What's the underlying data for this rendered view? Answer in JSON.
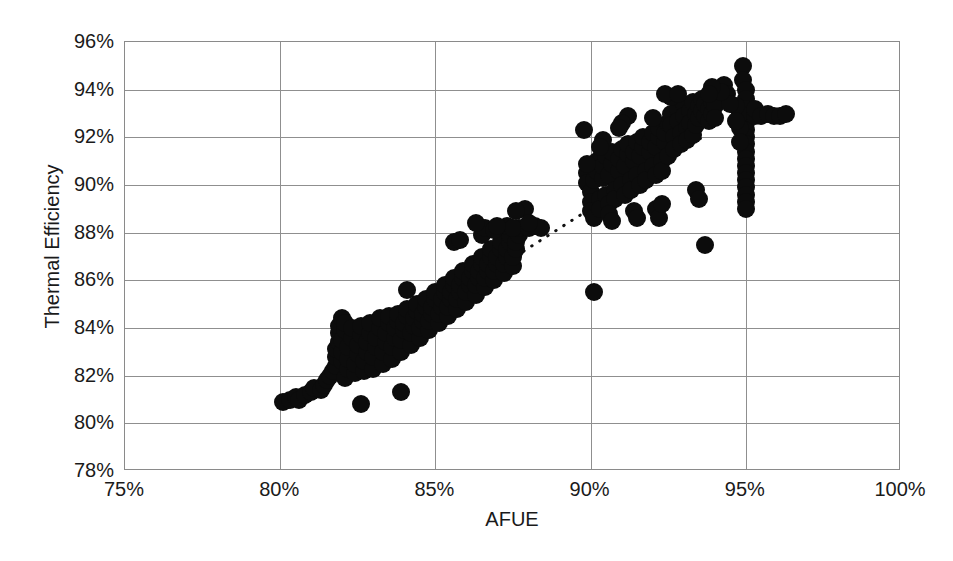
{
  "chart_data": {
    "type": "scatter",
    "title": "",
    "xlabel": "AFUE",
    "ylabel": "Thermal Efficiency",
    "xlim": [
      75,
      100
    ],
    "ylim": [
      78,
      96
    ],
    "xticks": [
      "75%",
      "80%",
      "85%",
      "90%",
      "95%",
      "100%"
    ],
    "xtick_values": [
      75,
      80,
      85,
      90,
      95,
      100
    ],
    "yticks": [
      "78%",
      "80%",
      "82%",
      "84%",
      "86%",
      "88%",
      "90%",
      "92%",
      "94%",
      "96%"
    ],
    "ytick_values": [
      78,
      80,
      82,
      84,
      86,
      88,
      90,
      92,
      94,
      96
    ],
    "grid": true,
    "legend": null,
    "marker": {
      "shape": "circle",
      "color": "#0c0c0c",
      "size_px": 18
    },
    "trendline": {
      "style": "dotted",
      "color": "#111111",
      "x_start": 80.1,
      "y_start": 80.8,
      "x_end": 93.6,
      "y_end": 92.0
    },
    "points": [
      [
        80.1,
        80.9
      ],
      [
        80.3,
        81.0
      ],
      [
        80.5,
        81.1
      ],
      [
        80.6,
        81.0
      ],
      [
        80.8,
        81.2
      ],
      [
        81.0,
        81.3
      ],
      [
        81.1,
        81.5
      ],
      [
        81.3,
        81.4
      ],
      [
        81.4,
        81.6
      ],
      [
        81.5,
        81.8
      ],
      [
        81.6,
        82.0
      ],
      [
        81.7,
        82.2
      ],
      [
        81.8,
        82.4
      ],
      [
        81.8,
        82.8
      ],
      [
        81.8,
        83.1
      ],
      [
        81.9,
        83.4
      ],
      [
        81.9,
        83.8
      ],
      [
        81.9,
        84.1
      ],
      [
        82.0,
        84.4
      ],
      [
        82.0,
        82.6
      ],
      [
        82.0,
        83.0
      ],
      [
        82.0,
        83.5
      ],
      [
        82.1,
        83.9
      ],
      [
        82.1,
        84.2
      ],
      [
        82.1,
        81.9
      ],
      [
        82.2,
        82.3
      ],
      [
        82.2,
        82.7
      ],
      [
        82.2,
        83.2
      ],
      [
        82.3,
        83.6
      ],
      [
        82.3,
        84.0
      ],
      [
        82.4,
        82.1
      ],
      [
        82.4,
        82.5
      ],
      [
        82.5,
        82.9
      ],
      [
        82.5,
        83.3
      ],
      [
        82.6,
        83.7
      ],
      [
        82.6,
        84.1
      ],
      [
        82.7,
        82.2
      ],
      [
        82.7,
        82.6
      ],
      [
        82.8,
        83.0
      ],
      [
        82.8,
        83.4
      ],
      [
        82.9,
        83.8
      ],
      [
        82.9,
        84.2
      ],
      [
        82.6,
        80.8
      ],
      [
        83.0,
        82.3
      ],
      [
        83.0,
        82.8
      ],
      [
        83.1,
        83.2
      ],
      [
        83.1,
        83.6
      ],
      [
        83.2,
        84.0
      ],
      [
        83.2,
        84.4
      ],
      [
        83.3,
        82.5
      ],
      [
        83.3,
        83.0
      ],
      [
        83.4,
        83.4
      ],
      [
        83.4,
        83.8
      ],
      [
        83.5,
        84.2
      ],
      [
        83.5,
        84.5
      ],
      [
        83.6,
        82.7
      ],
      [
        83.6,
        83.2
      ],
      [
        83.7,
        83.6
      ],
      [
        83.7,
        84.0
      ],
      [
        83.8,
        84.3
      ],
      [
        83.8,
        84.6
      ],
      [
        83.9,
        83.0
      ],
      [
        83.9,
        83.5
      ],
      [
        84.0,
        83.9
      ],
      [
        84.0,
        84.2
      ],
      [
        84.1,
        84.5
      ],
      [
        84.1,
        84.8
      ],
      [
        83.9,
        81.3
      ],
      [
        84.2,
        83.3
      ],
      [
        84.2,
        83.8
      ],
      [
        84.3,
        84.1
      ],
      [
        84.3,
        84.4
      ],
      [
        84.4,
        84.7
      ],
      [
        84.4,
        85.0
      ],
      [
        84.5,
        83.6
      ],
      [
        84.5,
        84.0
      ],
      [
        84.6,
        84.3
      ],
      [
        84.6,
        84.6
      ],
      [
        84.7,
        84.9
      ],
      [
        84.7,
        85.2
      ],
      [
        84.1,
        85.6
      ],
      [
        84.8,
        83.9
      ],
      [
        84.8,
        84.3
      ],
      [
        84.9,
        84.6
      ],
      [
        84.9,
        84.9
      ],
      [
        85.0,
        85.2
      ],
      [
        85.0,
        85.5
      ],
      [
        85.1,
        84.2
      ],
      [
        85.1,
        84.6
      ],
      [
        85.2,
        84.9
      ],
      [
        85.2,
        85.2
      ],
      [
        85.3,
        85.5
      ],
      [
        85.3,
        85.8
      ],
      [
        85.4,
        84.5
      ],
      [
        85.4,
        84.9
      ],
      [
        85.5,
        85.2
      ],
      [
        85.5,
        85.5
      ],
      [
        85.6,
        85.8
      ],
      [
        85.6,
        86.1
      ],
      [
        85.7,
        84.8
      ],
      [
        85.7,
        85.2
      ],
      [
        85.8,
        85.5
      ],
      [
        85.8,
        85.8
      ],
      [
        85.9,
        86.1
      ],
      [
        85.9,
        86.4
      ],
      [
        86.0,
        85.1
      ],
      [
        86.0,
        85.5
      ],
      [
        86.1,
        85.8
      ],
      [
        86.1,
        86.1
      ],
      [
        86.2,
        86.4
      ],
      [
        86.2,
        86.7
      ],
      [
        86.3,
        85.4
      ],
      [
        86.3,
        85.8
      ],
      [
        86.4,
        86.1
      ],
      [
        86.4,
        86.4
      ],
      [
        86.5,
        86.7
      ],
      [
        86.5,
        87.0
      ],
      [
        86.6,
        85.7
      ],
      [
        86.6,
        86.1
      ],
      [
        86.7,
        86.4
      ],
      [
        86.7,
        86.7
      ],
      [
        86.8,
        87.0
      ],
      [
        86.8,
        87.3
      ],
      [
        86.9,
        86.0
      ],
      [
        86.9,
        86.4
      ],
      [
        87.0,
        86.7
      ],
      [
        87.0,
        87.0
      ],
      [
        87.1,
        87.3
      ],
      [
        87.1,
        87.6
      ],
      [
        86.5,
        87.9
      ],
      [
        86.6,
        88.2
      ],
      [
        86.3,
        88.4
      ],
      [
        87.2,
        86.3
      ],
      [
        87.2,
        86.7
      ],
      [
        87.3,
        87.0
      ],
      [
        87.3,
        87.3
      ],
      [
        87.4,
        87.6
      ],
      [
        87.4,
        87.9
      ],
      [
        87.5,
        86.6
      ],
      [
        87.5,
        87.0
      ],
      [
        87.6,
        87.3
      ],
      [
        87.6,
        87.6
      ],
      [
        87.7,
        87.9
      ],
      [
        87.7,
        88.2
      ],
      [
        87.3,
        88.3
      ],
      [
        87.5,
        88.2
      ],
      [
        86.9,
        88.1
      ],
      [
        87.0,
        88.3
      ],
      [
        85.6,
        87.6
      ],
      [
        85.8,
        87.7
      ],
      [
        88.0,
        88.2
      ],
      [
        88.2,
        88.3
      ],
      [
        87.9,
        89.0
      ],
      [
        87.6,
        88.9
      ],
      [
        88.4,
        88.2
      ],
      [
        88.0,
        88.4
      ],
      [
        89.8,
        92.3
      ],
      [
        89.9,
        90.5
      ],
      [
        89.9,
        90.1
      ],
      [
        90.0,
        89.7
      ],
      [
        90.0,
        89.3
      ],
      [
        90.0,
        88.9
      ],
      [
        90.1,
        88.6
      ],
      [
        90.1,
        90.2
      ],
      [
        90.2,
        90.6
      ],
      [
        90.2,
        91.0
      ],
      [
        90.3,
        89.4
      ],
      [
        90.3,
        89.0
      ],
      [
        90.4,
        90.3
      ],
      [
        90.4,
        90.8
      ],
      [
        90.5,
        91.2
      ],
      [
        90.5,
        89.6
      ],
      [
        90.6,
        89.2
      ],
      [
        90.6,
        90.4
      ],
      [
        90.7,
        90.9
      ],
      [
        90.7,
        91.4
      ],
      [
        90.8,
        89.8
      ],
      [
        90.8,
        89.4
      ],
      [
        90.9,
        90.6
      ],
      [
        90.9,
        91.1
      ],
      [
        91.0,
        91.5
      ],
      [
        91.0,
        90.0
      ],
      [
        91.1,
        89.6
      ],
      [
        91.1,
        90.8
      ],
      [
        91.2,
        91.3
      ],
      [
        91.2,
        91.7
      ],
      [
        91.3,
        90.2
      ],
      [
        91.3,
        89.8
      ],
      [
        91.4,
        91.0
      ],
      [
        91.4,
        91.4
      ],
      [
        91.5,
        91.8
      ],
      [
        91.5,
        90.4
      ],
      [
        91.6,
        90.0
      ],
      [
        91.6,
        91.2
      ],
      [
        91.7,
        91.6
      ],
      [
        91.7,
        92.0
      ],
      [
        91.8,
        90.6
      ],
      [
        91.8,
        90.2
      ],
      [
        91.9,
        91.4
      ],
      [
        91.9,
        91.8
      ],
      [
        92.0,
        92.2
      ],
      [
        92.0,
        90.8
      ],
      [
        92.1,
        90.4
      ],
      [
        92.1,
        91.6
      ],
      [
        92.2,
        92.0
      ],
      [
        92.2,
        92.4
      ],
      [
        92.3,
        91.0
      ],
      [
        92.3,
        90.6
      ],
      [
        92.4,
        91.8
      ],
      [
        92.4,
        92.2
      ],
      [
        92.5,
        92.6
      ],
      [
        92.5,
        91.2
      ],
      [
        92.6,
        93.0
      ],
      [
        92.6,
        92.5
      ],
      [
        92.7,
        92.0
      ],
      [
        92.7,
        91.5
      ],
      [
        92.8,
        93.2
      ],
      [
        92.8,
        92.7
      ],
      [
        92.9,
        92.2
      ],
      [
        92.9,
        91.7
      ],
      [
        93.0,
        93.4
      ],
      [
        93.0,
        92.9
      ],
      [
        93.1,
        92.4
      ],
      [
        93.1,
        91.9
      ],
      [
        93.2,
        93.1
      ],
      [
        93.2,
        92.6
      ],
      [
        93.3,
        92.1
      ],
      [
        93.3,
        93.5
      ],
      [
        93.4,
        93.0
      ],
      [
        93.4,
        92.5
      ],
      [
        93.5,
        93.3
      ],
      [
        93.5,
        92.8
      ],
      [
        93.6,
        93.6
      ],
      [
        93.6,
        93.1
      ],
      [
        93.7,
        92.9
      ],
      [
        93.7,
        93.4
      ],
      [
        93.8,
        93.2
      ],
      [
        93.8,
        92.7
      ],
      [
        93.9,
        93.5
      ],
      [
        93.9,
        93.0
      ],
      [
        94.0,
        93.3
      ],
      [
        94.0,
        92.8
      ],
      [
        93.4,
        89.8
      ],
      [
        93.5,
        89.4
      ],
      [
        93.7,
        87.5
      ],
      [
        90.1,
        85.5
      ],
      [
        92.1,
        89.0
      ],
      [
        92.2,
        88.6
      ],
      [
        92.3,
        89.2
      ],
      [
        91.4,
        88.9
      ],
      [
        91.5,
        88.6
      ],
      [
        90.6,
        88.8
      ],
      [
        90.7,
        88.5
      ],
      [
        94.9,
        95.0
      ],
      [
        94.9,
        94.4
      ],
      [
        95.0,
        94.0
      ],
      [
        95.0,
        93.6
      ],
      [
        95.0,
        93.2
      ],
      [
        95.0,
        92.9
      ],
      [
        95.0,
        92.6
      ],
      [
        95.0,
        92.3
      ],
      [
        95.0,
        92.0
      ],
      [
        95.0,
        91.7
      ],
      [
        95.0,
        91.4
      ],
      [
        95.0,
        91.1
      ],
      [
        95.0,
        90.8
      ],
      [
        95.0,
        90.5
      ],
      [
        95.0,
        90.2
      ],
      [
        95.0,
        89.9
      ],
      [
        95.0,
        89.6
      ],
      [
        95.0,
        89.3
      ],
      [
        95.0,
        89.0
      ],
      [
        94.8,
        93.0
      ],
      [
        94.8,
        92.4
      ],
      [
        94.8,
        91.8
      ],
      [
        94.7,
        93.3
      ],
      [
        94.7,
        92.7
      ],
      [
        95.3,
        92.9
      ],
      [
        95.3,
        93.2
      ],
      [
        95.5,
        92.9
      ],
      [
        95.7,
        93.0
      ],
      [
        95.9,
        92.9
      ],
      [
        96.1,
        92.9
      ],
      [
        96.3,
        93.0
      ],
      [
        94.3,
        94.2
      ],
      [
        94.4,
        93.8
      ],
      [
        94.5,
        93.4
      ],
      [
        94.2,
        93.9
      ],
      [
        93.9,
        94.1
      ],
      [
        93.8,
        93.8
      ],
      [
        92.6,
        93.7
      ],
      [
        92.4,
        93.8
      ],
      [
        92.8,
        93.8
      ],
      [
        91.2,
        92.9
      ],
      [
        91.0,
        92.6
      ],
      [
        90.9,
        92.4
      ],
      [
        92.0,
        92.8
      ],
      [
        90.4,
        91.9
      ],
      [
        90.3,
        91.6
      ],
      [
        89.9,
        90.9
      ]
    ]
  }
}
